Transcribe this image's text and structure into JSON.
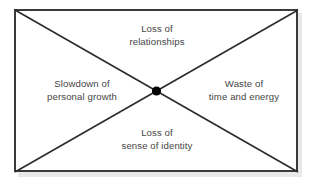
{
  "diagram": {
    "type": "x-cross-quadrant-diagram",
    "shape": "rectangle",
    "center_marker": "filled-black-dot",
    "colors": {
      "border": "#3a3a3a",
      "diagonal_line": "#2b2b2b",
      "center_dot": "#000000",
      "text": "#454545",
      "background": "#ffffff",
      "shadow": "#e9e9e9"
    },
    "labels": {
      "top": {
        "line1": "Loss of",
        "line2": "relationships"
      },
      "left": {
        "line1": "Slowdown of",
        "line2": "personal growth"
      },
      "right": {
        "line1": "Waste of",
        "line2": "time and energy"
      },
      "bottom": {
        "line1": "Loss of",
        "line2": "sense of identity"
      }
    }
  }
}
